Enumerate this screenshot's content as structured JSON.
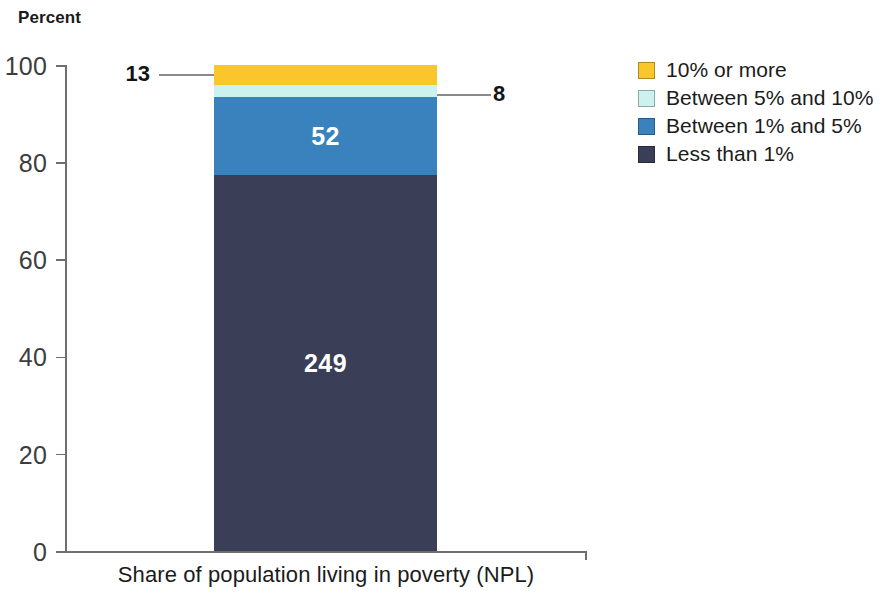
{
  "chart_data": {
    "type": "bar",
    "title": "",
    "ylabel": "Percent",
    "xlabel": "Share of population living in poverty (NPL)",
    "categories": [
      "Share of population living in poverty (NPL)"
    ],
    "ylim": [
      0,
      100
    ],
    "yticks": [
      "0",
      "20",
      "40",
      "60",
      "80",
      "100"
    ],
    "grid": false,
    "legend_position": "right",
    "stacked": true,
    "value_unit": "count of countries",
    "total": 322,
    "series": [
      {
        "name": "10% or more",
        "color": "#F9C72C",
        "values": [
          13
        ],
        "percent": 4.04,
        "label": "13",
        "label_placement": "callout-left"
      },
      {
        "name": "Between 5% and 10%",
        "color": "#CCF2F0",
        "values": [
          8
        ],
        "percent": 2.48,
        "label": "8",
        "label_placement": "callout-right"
      },
      {
        "name": "Between 1% and 5%",
        "color": "#3A82BE",
        "values": [
          52
        ],
        "percent": 16.15,
        "label": "52",
        "label_placement": "inside"
      },
      {
        "name": "Less than 1%",
        "color": "#3A3E56",
        "values": [
          249
        ],
        "percent": 77.33,
        "label": "249",
        "label_placement": "inside"
      }
    ]
  },
  "axis": {
    "y_title": "Percent",
    "x_caption": "Share of population living in poverty (NPL)",
    "ticks": [
      {
        "label": "100",
        "value": 100
      },
      {
        "label": "80",
        "value": 80
      },
      {
        "label": "60",
        "value": 60
      },
      {
        "label": "40",
        "value": 40
      },
      {
        "label": "20",
        "value": 20
      },
      {
        "label": "0",
        "value": 0
      }
    ]
  },
  "callouts": [
    {
      "text": "13",
      "side": "left"
    },
    {
      "text": "8",
      "side": "right"
    }
  ],
  "legend": {
    "items": [
      {
        "label": "10% or more",
        "color": "#F9C72C"
      },
      {
        "label": "Between 5% and 10%",
        "color": "#CCF2F0"
      },
      {
        "label": "Between 1% and 5%",
        "color": "#3A82BE"
      },
      {
        "label": "Less than 1%",
        "color": "#3A3E56"
      }
    ]
  }
}
